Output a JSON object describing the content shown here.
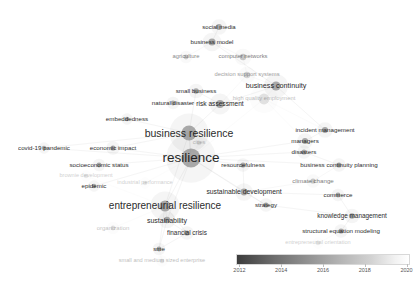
{
  "visualization": {
    "type": "bibliometric-keyword-cooccurrence-network",
    "title": "Keyword co-occurrence overlay visualization",
    "background_color": "#ffffff",
    "label_color": "#1a1a1a",
    "node_color": "#8c8c8c",
    "edge_color": "#d9d9d9"
  },
  "legend": {
    "name": "avg-publication-year-colorbar",
    "gradient_from": "#3c3c3c",
    "gradient_to": "#ffffff",
    "min": 2012,
    "max": 2020,
    "ticks": [
      {
        "label": "2012",
        "pos": 2
      },
      {
        "label": "2014",
        "pos": 26
      },
      {
        "label": "2016",
        "pos": 50
      },
      {
        "label": "2018",
        "pos": 74
      },
      {
        "label": "2020",
        "pos": 98
      }
    ]
  },
  "chart_data": {
    "type": "scatter",
    "xlabel": "",
    "ylabel": "",
    "colorbar_label": "avg. publication year",
    "colorbar_range": [
      2012,
      2020
    ],
    "nodes": [
      {
        "label": "social media",
        "x": 219,
        "y": 27,
        "r": 3.0,
        "size": 3,
        "opacity": 0.95,
        "font": 6.0
      },
      {
        "label": "business model",
        "x": 212,
        "y": 42,
        "r": 3.6,
        "size": 4,
        "opacity": 0.95,
        "font": 6.2
      },
      {
        "label": "agriculture",
        "x": 186,
        "y": 57,
        "r": 2.4,
        "size": 2,
        "opacity": 0.55,
        "font": 5.8
      },
      {
        "label": "computer networks",
        "x": 243,
        "y": 57,
        "r": 3.2,
        "size": 3,
        "opacity": 0.6,
        "font": 5.8
      },
      {
        "label": "decision support systems",
        "x": 247,
        "y": 75,
        "r": 3.2,
        "size": 3,
        "opacity": 0.45,
        "font": 5.8
      },
      {
        "label": "business continuity",
        "x": 276,
        "y": 86,
        "r": 4.6,
        "size": 6,
        "opacity": 0.95,
        "font": 7.2
      },
      {
        "label": "small business",
        "x": 196,
        "y": 91,
        "r": 2.8,
        "size": 3,
        "opacity": 0.95,
        "font": 6.2
      },
      {
        "label": "natural disaster",
        "x": 173,
        "y": 103,
        "r": 2.4,
        "size": 2,
        "opacity": 0.95,
        "font": 6.2
      },
      {
        "label": "risk assessment",
        "x": 220,
        "y": 104,
        "r": 4.0,
        "size": 4,
        "opacity": 0.95,
        "font": 6.6
      },
      {
        "label": "high quality employment",
        "x": 264,
        "y": 99,
        "r": 5.4,
        "size": 7,
        "opacity": 0.3,
        "font": 5.8
      },
      {
        "label": "embeddedness",
        "x": 127,
        "y": 119,
        "r": 2.2,
        "size": 2,
        "opacity": 0.95,
        "font": 6.2
      },
      {
        "label": "incident management",
        "x": 325,
        "y": 130,
        "r": 3.0,
        "size": 3,
        "opacity": 0.95,
        "font": 6.2
      },
      {
        "label": "business resilience",
        "x": 189,
        "y": 133,
        "r": 7.5,
        "size": 11,
        "opacity": 0.95,
        "font": 10.5
      },
      {
        "label": "managers",
        "x": 305,
        "y": 141,
        "r": 3.0,
        "size": 3,
        "opacity": 0.95,
        "font": 6.2
      },
      {
        "label": "cities",
        "x": 199,
        "y": 143,
        "r": 2.2,
        "size": 2,
        "opacity": 0.28,
        "font": 5.6
      },
      {
        "label": "covid-19 pandemic",
        "x": 44,
        "y": 148,
        "r": 2.2,
        "size": 2,
        "opacity": 0.95,
        "font": 6.2
      },
      {
        "label": "economic impact",
        "x": 113,
        "y": 148,
        "r": 2.6,
        "size": 2,
        "opacity": 0.95,
        "font": 6.2
      },
      {
        "label": "resilience",
        "x": 191,
        "y": 158,
        "r": 9.5,
        "size": 14,
        "opacity": 0.95,
        "font": 13.5
      },
      {
        "label": "disasters",
        "x": 304,
        "y": 152,
        "r": 2.6,
        "size": 2,
        "opacity": 0.95,
        "font": 6.2
      },
      {
        "label": "socioeconomic status",
        "x": 99,
        "y": 165,
        "r": 2.4,
        "size": 2,
        "opacity": 0.95,
        "font": 6.2
      },
      {
        "label": "resourcefulness",
        "x": 243,
        "y": 165,
        "r": 2.6,
        "size": 2,
        "opacity": 0.95,
        "font": 6.2
      },
      {
        "label": "business continuity planning",
        "x": 339,
        "y": 165,
        "r": 2.6,
        "size": 2,
        "opacity": 0.95,
        "font": 6.2
      },
      {
        "label": "brownie development",
        "x": 86,
        "y": 176,
        "r": 2.2,
        "size": 2,
        "opacity": 0.22,
        "font": 5.6
      },
      {
        "label": "epidemic",
        "x": 94,
        "y": 186,
        "r": 2.2,
        "size": 2,
        "opacity": 0.95,
        "font": 6.2
      },
      {
        "label": "industrial performance",
        "x": 145,
        "y": 183,
        "r": 2.2,
        "size": 2,
        "opacity": 0.22,
        "font": 5.6
      },
      {
        "label": "climate change",
        "x": 313,
        "y": 181,
        "r": 2.6,
        "size": 2,
        "opacity": 0.6,
        "font": 6.2
      },
      {
        "label": "sustainable development",
        "x": 244,
        "y": 192,
        "r": 3.4,
        "size": 3,
        "opacity": 0.95,
        "font": 6.8
      },
      {
        "label": "commerce",
        "x": 338,
        "y": 195,
        "r": 2.4,
        "size": 2,
        "opacity": 0.95,
        "font": 6.2
      },
      {
        "label": "entrepreneurial resilience",
        "x": 165,
        "y": 206,
        "r": 5.6,
        "size": 8,
        "opacity": 0.95,
        "font": 10.0
      },
      {
        "label": "strategy",
        "x": 266,
        "y": 205,
        "r": 2.6,
        "size": 2,
        "opacity": 0.95,
        "font": 6.2
      },
      {
        "label": "knowledge management",
        "x": 352,
        "y": 216,
        "r": 2.8,
        "size": 3,
        "opacity": 0.95,
        "font": 6.4
      },
      {
        "label": "sustainability",
        "x": 167,
        "y": 220,
        "r": 3.2,
        "size": 3,
        "opacity": 0.95,
        "font": 7.0
      },
      {
        "label": "organization",
        "x": 113,
        "y": 228,
        "r": 2.4,
        "size": 2,
        "opacity": 0.28,
        "font": 6.0
      },
      {
        "label": "financial crisis",
        "x": 187,
        "y": 233,
        "r": 2.6,
        "size": 2,
        "opacity": 0.95,
        "font": 6.4
      },
      {
        "label": "structural equation modeling",
        "x": 341,
        "y": 231,
        "r": 2.6,
        "size": 2,
        "opacity": 0.95,
        "font": 6.2
      },
      {
        "label": "entrepreneurial orientation",
        "x": 318,
        "y": 243,
        "r": 2.2,
        "size": 2,
        "opacity": 0.22,
        "font": 5.6
      },
      {
        "label": "sme",
        "x": 159,
        "y": 249,
        "r": 2.4,
        "size": 2,
        "opacity": 0.95,
        "font": 6.2
      },
      {
        "label": "small and medium sized enterprise",
        "x": 162,
        "y": 261,
        "r": 2.2,
        "size": 2,
        "opacity": 0.3,
        "font": 5.6
      }
    ],
    "edges": [
      [
        0,
        1
      ],
      [
        1,
        2
      ],
      [
        1,
        3
      ],
      [
        1,
        5
      ],
      [
        3,
        4
      ],
      [
        4,
        5
      ],
      [
        4,
        8
      ],
      [
        5,
        9
      ],
      [
        5,
        11
      ],
      [
        6,
        8
      ],
      [
        6,
        12
      ],
      [
        7,
        8
      ],
      [
        8,
        12
      ],
      [
        8,
        9
      ],
      [
        9,
        11
      ],
      [
        9,
        13
      ],
      [
        9,
        17
      ],
      [
        10,
        12
      ],
      [
        11,
        13
      ],
      [
        12,
        17
      ],
      [
        12,
        15
      ],
      [
        12,
        16
      ],
      [
        13,
        17
      ],
      [
        14,
        17
      ],
      [
        15,
        17
      ],
      [
        16,
        17
      ],
      [
        17,
        19
      ],
      [
        17,
        20
      ],
      [
        17,
        23
      ],
      [
        17,
        24
      ],
      [
        17,
        26
      ],
      [
        17,
        28
      ],
      [
        17,
        29
      ],
      [
        17,
        31
      ],
      [
        17,
        18
      ],
      [
        17,
        21
      ],
      [
        18,
        21
      ],
      [
        20,
        26
      ],
      [
        21,
        25
      ],
      [
        22,
        28
      ],
      [
        25,
        26
      ],
      [
        26,
        27
      ],
      [
        26,
        29
      ],
      [
        27,
        30
      ],
      [
        28,
        31
      ],
      [
        28,
        32
      ],
      [
        28,
        33
      ],
      [
        28,
        36
      ],
      [
        29,
        30
      ],
      [
        30,
        34
      ],
      [
        31,
        33
      ],
      [
        31,
        36
      ],
      [
        33,
        36
      ],
      [
        34,
        35
      ],
      [
        36,
        37
      ],
      [
        5,
        8
      ],
      [
        12,
        28
      ],
      [
        17,
        12
      ]
    ]
  }
}
